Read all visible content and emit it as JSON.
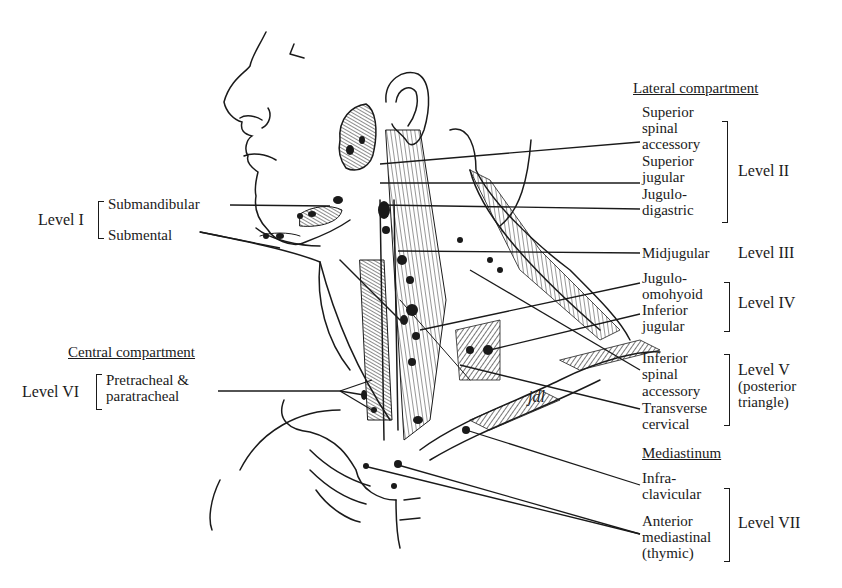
{
  "figure": {
    "type": "anatomical-diagram",
    "artist_signature": "jdl"
  },
  "left_labels": {
    "level1": {
      "level": "Level I",
      "items": [
        "Submandibular",
        "Submental"
      ]
    },
    "central_header": "Central compartment",
    "level6": {
      "level": "Level VI",
      "items": [
        "Pretracheal &",
        "paratracheal"
      ]
    }
  },
  "right_labels": {
    "lateral_header": "Lateral compartment",
    "level2": {
      "level": "Level II",
      "items": [
        "Superior",
        "spinal",
        "accessory",
        "Superior",
        "jugular",
        "Jugulo-",
        "digastric"
      ]
    },
    "level3": {
      "level": "Level III",
      "items": [
        "Midjugular"
      ]
    },
    "level4": {
      "level": "Level IV",
      "items": [
        "Jugulo-",
        "omohyoid",
        "Inferior",
        "jugular"
      ]
    },
    "level5": {
      "level": "Level V",
      "sublabel1": "(posterior",
      "sublabel2": "triangle)",
      "items": [
        "Inferior",
        "spinal",
        "accessory",
        "Transverse",
        "cervical"
      ]
    },
    "mediastinum_header": "Mediastinum",
    "level7": {
      "level": "Level VII",
      "items": [
        "Infra-",
        "clavicular",
        "Anterior",
        "mediastinal",
        "(thymic)"
      ]
    }
  },
  "colors": {
    "ink": "#1a1a1a",
    "background": "#ffffff"
  }
}
